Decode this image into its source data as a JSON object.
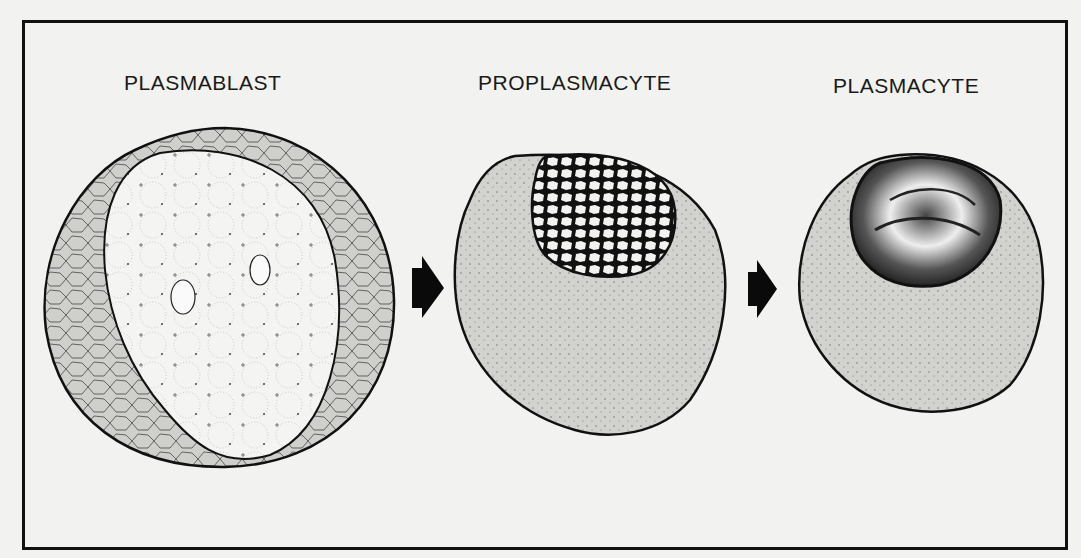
{
  "diagram": {
    "stages": [
      {
        "label": "PLASMABLAST",
        "description": "Large cell with large pale vesicular nucleus and reticulated cytoplasm"
      },
      {
        "label": "PROPLASMACYTE",
        "description": "Stippled cytoplasm with eccentric nucleus showing coarse chromatin network"
      },
      {
        "label": "PLASMACYTE",
        "description": "Stippled cytoplasm with eccentric dense condensed nucleus"
      }
    ],
    "arrows": [
      {
        "from": "PLASMABLAST",
        "to": "PROPLASMACYTE"
      },
      {
        "from": "PROPLASMACYTE",
        "to": "PLASMACYTE"
      }
    ],
    "colors": {
      "background": "#f2f2f0",
      "ink": "#111111",
      "cytoplasm": "#cfcfcc",
      "nucleus_light": "#f4f4f2",
      "nucleus_dark": "#1a1a1a"
    }
  }
}
